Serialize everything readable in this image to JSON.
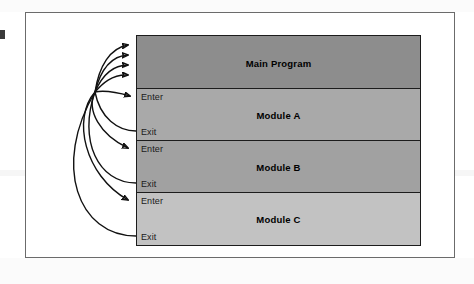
{
  "diagram": {
    "type": "module-hierarchy",
    "edge_mark": "page-edge-artifact",
    "boxes": [
      {
        "id": "main-program",
        "label": "Main Program",
        "fill": "#8d8d8d",
        "has_ports": false,
        "enter_label": "",
        "exit_label": ""
      },
      {
        "id": "module-a",
        "label": "Module A",
        "fill": "#a9a9a9",
        "has_ports": true,
        "enter_label": "Enter",
        "exit_label": "Exit"
      },
      {
        "id": "module-b",
        "label": "Module B",
        "fill": "#a1a1a1",
        "has_ports": true,
        "enter_label": "Enter",
        "exit_label": "Exit"
      },
      {
        "id": "module-c",
        "label": "Module C",
        "fill": "#c2c2c2",
        "has_ports": true,
        "enter_label": "Enter",
        "exit_label": "Exit"
      }
    ],
    "flow_arrows": {
      "count": 9,
      "into_main_program": 4,
      "into_enter_ports": 3,
      "out_of_exit_ports": 3,
      "color": "#111111",
      "description": "Control flow curves converging at a single junction point left of the module stack"
    },
    "frame": {
      "border_color": "#6b6b6b",
      "background": "#ffffff"
    }
  }
}
